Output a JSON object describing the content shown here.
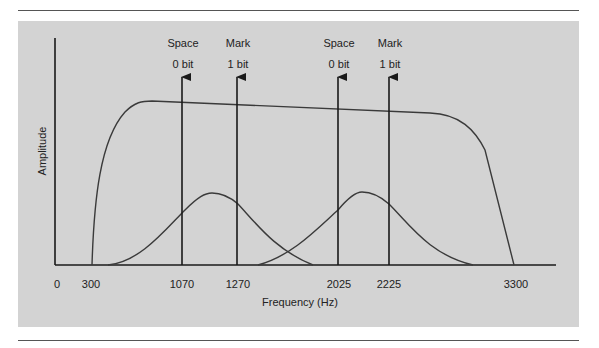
{
  "diagram": {
    "title": "",
    "y_axis_label": "Amplitude",
    "x_axis_label": "Frequency (Hz)",
    "x_ticks": [
      "0",
      "300",
      "1070",
      "1270",
      "2025",
      "2225",
      "3300"
    ],
    "arrows": [
      {
        "top": "Space",
        "bottom": "0 bit",
        "freq": "1070"
      },
      {
        "top": "Mark",
        "bottom": "1 bit",
        "freq": "1270"
      },
      {
        "top": "Space",
        "bottom": "0 bit",
        "freq": "2025"
      },
      {
        "top": "Mark",
        "bottom": "1 bit",
        "freq": "2225"
      }
    ],
    "curves": [
      {
        "name": "channel-passband",
        "from": "300",
        "to": "3300"
      },
      {
        "name": "low-channel-spectrum",
        "center_between": [
          "1070",
          "1270"
        ]
      },
      {
        "name": "high-channel-spectrum",
        "center_between": [
          "2025",
          "2225"
        ]
      }
    ],
    "colors": {
      "panel": "#d3d3d3",
      "line": "#2a2a2a",
      "rule": "#555555"
    }
  }
}
